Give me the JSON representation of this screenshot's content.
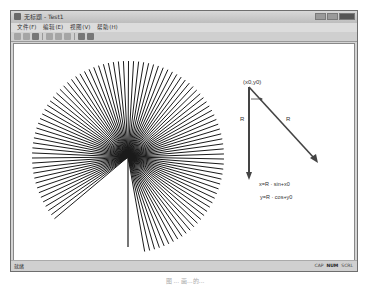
{
  "window": {
    "title": "无标题 - Test1",
    "icon": "app-icon",
    "controls": [
      "minimize-icon",
      "maximize-icon",
      "close-icon"
    ]
  },
  "menubar": {
    "items": [
      {
        "label": "文件(F)"
      },
      {
        "label": "编辑(E)"
      },
      {
        "label": "视图(V)"
      },
      {
        "label": "帮助(H)"
      }
    ]
  },
  "toolbar": {
    "buttons": [
      {
        "icon": "new-file-icon"
      },
      {
        "icon": "open-folder-icon"
      },
      {
        "icon": "save-icon"
      },
      {
        "icon": "cut-icon"
      },
      {
        "icon": "copy-icon"
      },
      {
        "icon": "paste-icon"
      },
      {
        "icon": "print-icon"
      },
      {
        "icon": "about-icon"
      }
    ]
  },
  "canvas": {
    "fan": {
      "center": [
        127,
        156
      ],
      "radius": 96,
      "line_count": 100,
      "start_angle_deg": 100,
      "end_angle_deg": 400,
      "color": "#1a1a1a"
    },
    "diagram": {
      "origin_label": "(x0,y0)",
      "vertical_label": "R",
      "diagonal_label": "R",
      "formula_x": "x=R · sin+x0",
      "formula_y": "y=R · cos+y0"
    }
  },
  "statusbar": {
    "left": "就绪",
    "indicators": [
      "CAP",
      "NUM",
      "SCRL"
    ],
    "active_indicator": "NUM"
  },
  "caption": "图 ... 画...的..."
}
